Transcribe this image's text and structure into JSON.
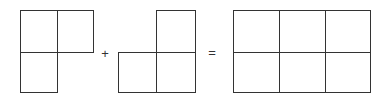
{
  "equation": {
    "operand_1": {
      "name": "L-shape of 3 squares (top-left, top-right, bottom-left)",
      "cells": [
        [
          0,
          0
        ],
        [
          1,
          0
        ],
        [
          0,
          1
        ]
      ]
    },
    "operator_plus": "+",
    "operand_2": {
      "name": "L-shape of 3 squares (top-right, bottom-left, bottom-right)",
      "cells": [
        [
          1,
          0
        ],
        [
          0,
          1
        ],
        [
          1,
          1
        ]
      ]
    },
    "operator_equals": "=",
    "result": {
      "name": "3x2 rectangle of 6 squares",
      "columns": 3,
      "rows": 2
    }
  },
  "colors": {
    "stroke": "#333333",
    "background": "#ffffff"
  }
}
